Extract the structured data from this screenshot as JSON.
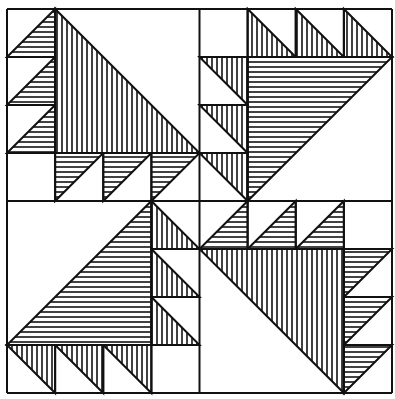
{
  "figure": {
    "colors": {
      "ink": "#111111",
      "paper": "#ffffff"
    },
    "frame": {
      "x0": 7,
      "y0": 9,
      "x1": 392,
      "y1": 393
    },
    "unit": 48,
    "quadrants": [
      {
        "name": "top-left",
        "big_triangle_hatch": "vertical",
        "small_triangle_hatch": "horizontal"
      },
      {
        "name": "top-right",
        "big_triangle_hatch": "horizontal",
        "small_triangle_hatch": "vertical"
      },
      {
        "name": "bottom-left",
        "big_triangle_hatch": "horizontal",
        "small_triangle_hatch": "vertical"
      },
      {
        "name": "bottom-right",
        "big_triangle_hatch": "vertical",
        "small_triangle_hatch": "horizontal"
      }
    ]
  }
}
